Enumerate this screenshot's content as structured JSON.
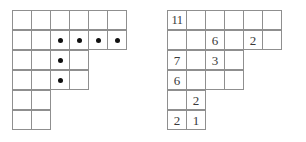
{
  "figure": {
    "kind": "young-diagram-pair",
    "cell_size_px": 20,
    "grid_line_color": "#8f8f8f",
    "mark_color": "#111111",
    "text_color": "#3a3a3a",
    "background": "#ffffff"
  },
  "diagrams": [
    {
      "name": "left-diagram",
      "label": "",
      "row_lengths": [
        6,
        6,
        4,
        4,
        2,
        2
      ],
      "content_type": "dots",
      "rows": [
        [
          "",
          "",
          "",
          "",
          "",
          ""
        ],
        [
          "",
          "",
          "dot",
          "dot",
          "dot",
          "dot"
        ],
        [
          "",
          "",
          "dot",
          ""
        ],
        [
          "",
          "",
          "dot",
          ""
        ],
        [
          "",
          ""
        ],
        [
          "",
          ""
        ]
      ],
      "dot_cells": [
        {
          "row": 2,
          "col": 3
        },
        {
          "row": 2,
          "col": 4
        },
        {
          "row": 2,
          "col": 5
        },
        {
          "row": 2,
          "col": 6
        },
        {
          "row": 3,
          "col": 3
        },
        {
          "row": 4,
          "col": 3
        }
      ],
      "dot_count": 6
    },
    {
      "name": "right-diagram",
      "label": "",
      "row_lengths": [
        6,
        6,
        4,
        4,
        2,
        2
      ],
      "content_type": "numbers",
      "rows": [
        [
          "11",
          "",
          "",
          "",
          "",
          ""
        ],
        [
          "",
          "",
          "6",
          "",
          "2",
          ""
        ],
        [
          "7",
          "",
          "3",
          ""
        ],
        [
          "6",
          "",
          "",
          ""
        ],
        [
          "",
          "2"
        ],
        [
          "2",
          "1"
        ]
      ],
      "filled_cells": [
        {
          "row": 1,
          "col": 1,
          "value": "11"
        },
        {
          "row": 2,
          "col": 3,
          "value": "6"
        },
        {
          "row": 2,
          "col": 5,
          "value": "2"
        },
        {
          "row": 3,
          "col": 1,
          "value": "7"
        },
        {
          "row": 3,
          "col": 3,
          "value": "3"
        },
        {
          "row": 4,
          "col": 1,
          "value": "6"
        },
        {
          "row": 5,
          "col": 2,
          "value": "2"
        },
        {
          "row": 6,
          "col": 1,
          "value": "2"
        },
        {
          "row": 6,
          "col": 2,
          "value": "1"
        }
      ],
      "values": [
        "11",
        "6",
        "2",
        "7",
        "3",
        "6",
        "2",
        "2",
        "1"
      ]
    }
  ]
}
